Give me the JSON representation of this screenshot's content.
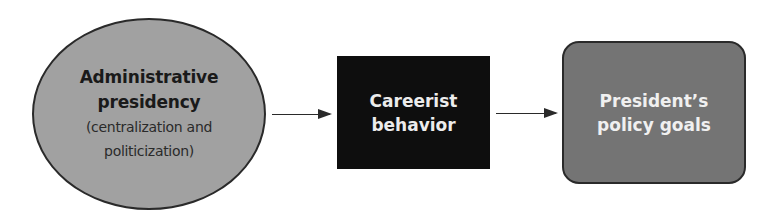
{
  "diagram": {
    "type": "flow",
    "direction": "left-to-right",
    "nodes": [
      {
        "id": "administrative-presidency",
        "shape": "ellipse",
        "title_lines": [
          "Administrative",
          "presidency"
        ],
        "subtitle_lines": [
          "(centralization and",
          "politicization)"
        ],
        "fill": "#a9a9a9",
        "text_color": "#1a1a1a"
      },
      {
        "id": "careerist-behavior",
        "shape": "rectangle",
        "title_lines": [
          "Careerist",
          "behavior"
        ],
        "fill": "#0e0e0e",
        "text_color": "#ececec"
      },
      {
        "id": "presidents-policy-goals",
        "shape": "rounded-rectangle",
        "title_lines": [
          "President’s",
          "policy goals"
        ],
        "fill": "#7b7b7b",
        "text_color": "#f0f0f0"
      }
    ],
    "edges": [
      {
        "from": "administrative-presidency",
        "to": "careerist-behavior"
      },
      {
        "from": "careerist-behavior",
        "to": "presidents-policy-goals"
      }
    ]
  }
}
